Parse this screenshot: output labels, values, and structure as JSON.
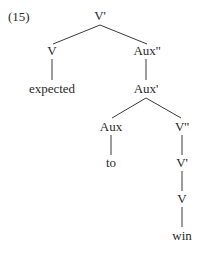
{
  "example_number": "(15)",
  "tree": {
    "root": "V'",
    "nodes": {
      "v_bar": "V'",
      "v_left": "V",
      "expected": "expected",
      "aux_dbl": "Aux''",
      "aux_bar": "Aux'",
      "aux": "Aux",
      "to": "to",
      "v_dbl": "V''",
      "v_bar2": "V'",
      "v": "V",
      "win": "win"
    },
    "edges": [
      [
        "V'",
        "V"
      ],
      [
        "V'",
        "Aux''"
      ],
      [
        "V",
        "expected"
      ],
      [
        "Aux''",
        "Aux'"
      ],
      [
        "Aux'",
        "Aux"
      ],
      [
        "Aux'",
        "V''"
      ],
      [
        "Aux",
        "to"
      ],
      [
        "V''",
        "V'"
      ],
      [
        "V'",
        "V"
      ],
      [
        "V",
        "win"
      ]
    ]
  }
}
